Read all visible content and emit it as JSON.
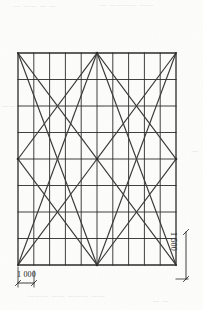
{
  "drawing": {
    "title": "Structural grid elevation with diagonal bracing",
    "type": "engineering-line-drawing",
    "media": "scanned monochrome print",
    "background_color": "#fdfdfb",
    "line_color": "#2b2b2b",
    "diagonal_color": "#3a3a3a",
    "grid": {
      "columns": 10,
      "rows": 8,
      "left": 18,
      "top": 53,
      "right": 176,
      "bottom": 265,
      "width": 158,
      "height": 212,
      "cell_width": 15.8,
      "cell_height": 26.5,
      "border_width_px": 1.3,
      "inner_line_width_px": 0.9
    },
    "bracing": {
      "description": "Diagonal members forming nested X / diamond pattern across the full panel",
      "node_points": [
        {
          "name": "top-center",
          "x": 97,
          "y": 53
        },
        {
          "name": "bottom-center",
          "x": 97,
          "y": 265
        },
        {
          "name": "left-mid",
          "x": 18,
          "y": 159
        },
        {
          "name": "right-mid",
          "x": 176,
          "y": 159
        },
        {
          "name": "center",
          "x": 97,
          "y": 159
        },
        {
          "name": "top-left",
          "x": 18,
          "y": 53
        },
        {
          "name": "top-right",
          "x": 176,
          "y": 53
        },
        {
          "name": "bottom-left",
          "x": 18,
          "y": 265
        },
        {
          "name": "bottom-right",
          "x": 176,
          "y": 265
        }
      ],
      "members": [
        {
          "x1": 18,
          "y1": 53,
          "x2": 97,
          "y2": 159
        },
        {
          "x1": 97,
          "y1": 159,
          "x2": 18,
          "y2": 265
        },
        {
          "x1": 176,
          "y1": 53,
          "x2": 97,
          "y2": 159
        },
        {
          "x1": 97,
          "y1": 159,
          "x2": 176,
          "y2": 265
        },
        {
          "x1": 18,
          "y1": 159,
          "x2": 97,
          "y2": 53
        },
        {
          "x1": 97,
          "y1": 53,
          "x2": 176,
          "y2": 159
        },
        {
          "x1": 18,
          "y1": 159,
          "x2": 97,
          "y2": 265
        },
        {
          "x1": 97,
          "y1": 265,
          "x2": 176,
          "y2": 159
        },
        {
          "x1": 18,
          "y1": 53,
          "x2": 97,
          "y2": 265
        },
        {
          "x1": 18,
          "y1": 265,
          "x2": 97,
          "y2": 53
        },
        {
          "x1": 176,
          "y1": 53,
          "x2": 97,
          "y2": 265
        },
        {
          "x1": 176,
          "y1": 265,
          "x2": 97,
          "y2": 53
        }
      ]
    },
    "dimensions": {
      "horizontal": {
        "label": "1 000",
        "value": 1000,
        "unit": "mm",
        "orientation": "horizontal",
        "extent_px": {
          "x1": 18,
          "x2": 34,
          "y": 283
        },
        "position": "below bottom-left of grid"
      },
      "vertical": {
        "label": "1 500",
        "value": 1500,
        "unit": "mm",
        "orientation": "vertical",
        "extent_px": {
          "y1": 232,
          "y2": 279,
          "x": 186
        },
        "position": "right of grid, lower portion"
      }
    },
    "ghost_marks": [
      {
        "text": "—  ——  — —",
        "x": 14,
        "y": 5
      },
      {
        "text": "— ———— ——",
        "x": 100,
        "y": 4
      },
      {
        "text": "——",
        "x": 3,
        "y": 105
      },
      {
        "text": "—— ——— —",
        "x": 60,
        "y": 105
      },
      {
        "text": "—",
        "x": 192,
        "y": 150
      },
      {
        "text": "——— —— ——— ——",
        "x": 30,
        "y": 295
      },
      {
        "text": "— —",
        "x": 155,
        "y": 300
      }
    ]
  }
}
